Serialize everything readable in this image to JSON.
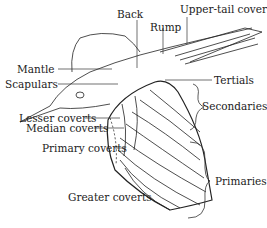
{
  "diagram": {
    "labels": {
      "back": "Back",
      "upper_tail_coverts": "Upper-tail coverts",
      "rump": "Rump",
      "mantle": "Mantle",
      "scapulars": "Scapulars",
      "tertials": "Tertials",
      "secondaries": "Secondaries",
      "lesser_coverts": "Lesser coverts",
      "median_coverts": "Median coverts",
      "primary_coverts": "Primary coverts",
      "primaries": "Primaries",
      "greater_coverts": "Greater coverts"
    },
    "colors": {
      "background": "#ffffff",
      "line": "#222222"
    }
  }
}
